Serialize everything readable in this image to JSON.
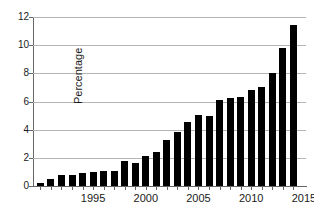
{
  "chart_data": {
    "type": "bar",
    "title": "",
    "subtitle": "",
    "xlabel": "",
    "ylabel": "Percentage",
    "ylim": [
      0,
      12
    ],
    "y_ticks": [
      0,
      2,
      4,
      6,
      8,
      10,
      12
    ],
    "y_tick_labels": [
      "0",
      "2",
      "4",
      "6",
      "8",
      "10",
      "12"
    ],
    "xlim": [
      1989.3,
      2015.2
    ],
    "x_ticks": [
      1995,
      2000,
      2005,
      2010,
      2015
    ],
    "x_tick_labels": [
      "1995",
      "2000",
      "2005",
      "2010",
      "2015"
    ],
    "grid": true,
    "grid_axis": "y",
    "legend": false,
    "legend_position": "none",
    "bar_color": "#000000",
    "categories": [
      "1990",
      "1991",
      "1992",
      "1993",
      "1994",
      "1995",
      "1996",
      "1997",
      "1998",
      "1999",
      "2000",
      "2001",
      "2002",
      "2003",
      "2004",
      "2005",
      "2006",
      "2007",
      "2008",
      "2009",
      "2010",
      "2011",
      "2012",
      "2013",
      "2014"
    ],
    "values": [
      0.2,
      0.5,
      0.8,
      0.75,
      0.9,
      1.0,
      1.05,
      1.05,
      1.8,
      1.65,
      2.15,
      2.45,
      3.3,
      3.85,
      4.55,
      5.05,
      5.0,
      6.1,
      6.25,
      6.35,
      6.8,
      7.05,
      8.0,
      9.8,
      11.4
    ],
    "series": [
      {
        "name": "Percentage",
        "values": [
          0.2,
          0.5,
          0.8,
          0.75,
          0.9,
          1.0,
          1.05,
          1.05,
          1.8,
          1.65,
          2.15,
          2.45,
          3.3,
          3.85,
          4.55,
          5.05,
          5.0,
          6.1,
          6.25,
          6.35,
          6.8,
          7.05,
          8.0,
          9.8,
          11.4
        ]
      }
    ],
    "annotations": []
  }
}
